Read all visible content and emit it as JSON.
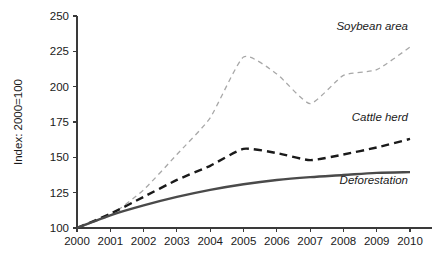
{
  "chart_data": {
    "type": "line",
    "title": "",
    "subtitle": "",
    "xlabel": "",
    "ylabel": "Index: 2000=100",
    "x": [
      2000,
      2001,
      2002,
      2003,
      2004,
      2005,
      2006,
      2007,
      2008,
      2009,
      2010
    ],
    "xticklabels": [
      "2000",
      "2001",
      "2002",
      "2003",
      "2004",
      "2005",
      "2006",
      "2007",
      "2008",
      "2009",
      "2010"
    ],
    "yticks": [
      100,
      125,
      150,
      175,
      200,
      225,
      250
    ],
    "yticklabels": [
      "100",
      "125",
      "150",
      "175",
      "200",
      "225",
      "250"
    ],
    "xlim": [
      2000,
      2010
    ],
    "ylim": [
      100,
      250
    ],
    "grid": false,
    "legend_position": "inline-end-of-line",
    "series": [
      {
        "name": "Soybean area",
        "values": [
          100,
          109,
          127,
          152,
          178,
          221,
          209,
          188,
          208,
          212,
          228
        ],
        "color": "#a8a8a8",
        "style": "dashed",
        "width": 1.3,
        "label_x": 2010,
        "label_y": 240
      },
      {
        "name": "Cattle herd",
        "values": [
          100,
          110,
          122,
          134,
          144,
          156,
          153,
          148,
          152,
          157,
          163
        ],
        "color": "#1a1a1a",
        "style": "dashed",
        "width": 2.4,
        "label_x": 2010,
        "label_y": 176
      },
      {
        "name": "Deforestation",
        "values": [
          100,
          109,
          116,
          122,
          127,
          131,
          134,
          136,
          137.5,
          139,
          139.5
        ],
        "color": "#4a4a4a",
        "style": "solid",
        "width": 2.4,
        "label_x": 2010,
        "label_y": 131
      }
    ]
  },
  "axis": {
    "y_title": "Index: 2000=100"
  }
}
